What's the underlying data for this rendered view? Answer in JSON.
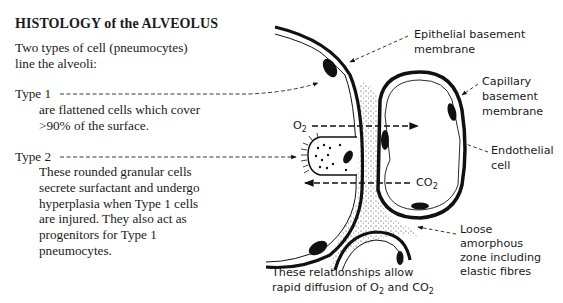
{
  "title": "HISTOLOGY of the ALVEOLUS",
  "intro": [
    "Two types of cell (pneumocytes)",
    "line the alveoli:"
  ],
  "type1": {
    "label": "Type 1",
    "description": [
      "are flattened cells which cover",
      ">90% of the surface."
    ]
  },
  "type2": {
    "label": "Type 2",
    "description": [
      "These rounded granular cells",
      "secrete surfactant and undergo",
      "hyperplasia when Type 1 cells",
      "are injured. They also act as",
      "progenitors for Type 1",
      "pneumocytes."
    ]
  },
  "labels": {
    "epithelial": [
      "Epithelial basement",
      "membrane"
    ],
    "capillary": [
      "Capillary",
      "basement",
      "membrane"
    ],
    "endothelial": [
      "Endothelial",
      "cell"
    ],
    "loose": [
      "Loose",
      "amorphous",
      "zone including",
      "elastic fibres"
    ],
    "o2": {
      "base": "O",
      "sub": "2"
    },
    "co2": {
      "base": "CO",
      "sub": "2"
    }
  },
  "caption": {
    "line1": "These relationships allow",
    "line2_prefix": "rapid diffusion of O",
    "line2_sub1": "2",
    "line2_mid": " and CO",
    "line2_sub2": "2"
  }
}
